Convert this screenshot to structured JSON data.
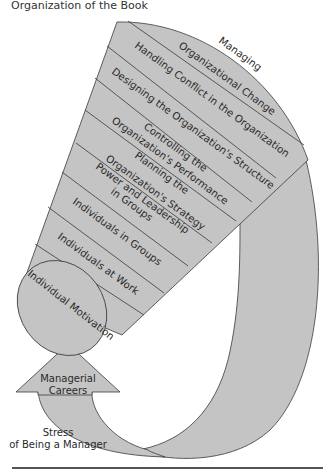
{
  "title": "Organization of the Book",
  "colors": {
    "fill": "#c4c4c4",
    "stroke": "#3a3a3a",
    "text": "#2a2a2a",
    "rule": "#555555"
  },
  "funnel_segments": [
    {
      "lines": [
        "Managing",
        "Organizational Change"
      ]
    },
    {
      "lines": [
        "Handling Conflict in the Organization"
      ]
    },
    {
      "lines": [
        "Designing the Organization's Structure"
      ]
    },
    {
      "lines": [
        "Controlling the",
        "Organization's Performance"
      ]
    },
    {
      "lines": [
        "Planning the",
        "Organization's Strategy"
      ]
    },
    {
      "lines": [
        "Power and Leadership",
        "in Groups"
      ]
    },
    {
      "lines": [
        "Individuals in Groups"
      ]
    },
    {
      "lines": [
        "Individuals at Work"
      ]
    }
  ],
  "ellipse_label": "Individual Motivation",
  "arrow_label": [
    "Managerial",
    "Careers"
  ],
  "loop_label": [
    "Stress",
    "of Being a Manager"
  ]
}
